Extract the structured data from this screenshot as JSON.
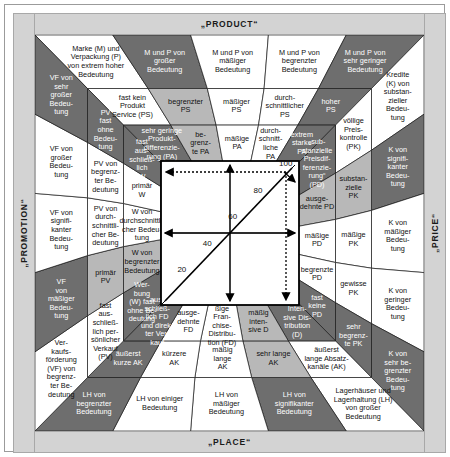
{
  "figure": {
    "title_top": "„PRODUCT“",
    "title_bottom": "„PLACE“",
    "title_left": "„PROMOTION“",
    "title_right": "„PRICE“",
    "type": "marketing-mix-matrix",
    "language": "de"
  },
  "colors": {
    "band": "#d3d3d3",
    "dark_gray": "#6e6e6e",
    "light_gray": "#b8b8b8",
    "white": "#ffffff",
    "line": "#1a1a1a"
  },
  "scale": {
    "axis_label": "Diagonalskala",
    "ticks": [
      "0",
      "20",
      "40",
      "60",
      "80",
      "100"
    ],
    "min": 0,
    "max": 100
  },
  "product": {
    "ring1": [
      "Marke (M) und\nVerpackung (P)\nvon extrem hoher\nBedeutung",
      "M und P von\ngroßer\nBedeutung",
      "M und P von\nmäßiger\nBedeutung",
      "M und P von\nbegrenzter\nBedeutung",
      "M und P von\nsehr geringer\nBedeutung"
    ],
    "ring2": [
      "fast kein\nProdukt\nService (PS)",
      "begrenzter\nPS",
      "mäßiger\nPS",
      "durch-\nschnittlicher\nPS",
      "hoher\nPS"
    ],
    "ring3": [
      "sehr geringe\nProdukt-\ndifferenzie-\nrung (PA)",
      "be-\ngrenz-\nte PA",
      "mäßige\nPA",
      "durch-\nschnitt-\nliche\nPA",
      "extrem\nstarke\nPA"
    ]
  },
  "promotion": {
    "ring1": [
      "Ver-\nkaufs-\nförderung\n(VF) von\nbegrenz-\nter Be-\ndeutung",
      "VF\nvon\nmäßiger\nBedeu-\ntung",
      "VF von\nsignifi-\nkanter\nBedeu-\ntung",
      "VF von\ngroßer\nBedeu-\ntung",
      "VF von\nsehr\ngroßer\nBedeu-\ntung"
    ],
    "ring2": [
      "fast\naus-\nschließ-\nlich per-\nsönlicher\nVerkauf\n(PV)",
      "primär\nPV",
      "PV von\ndurch-\nschnittli-\ncher Be-\ndeutung",
      "PV von\nbegrenz-\nter Be-\ndeutung",
      "PV\nfast\nohne\nBedeu-\ntung"
    ],
    "ring3": [
      "Wer-\nbung\n(W) fast\nohne Be-\ndeutung",
      "W von\nbegrenzter\nBedeutung",
      "W von\ndurchschnittli-\ncher Bedeu-\ntung",
      "primär\nW",
      "fast\naus-\nschließ-\nlich\nW"
    ]
  },
  "price": {
    "ring1": [
      "Kredite\n(K) von\nsubstan-\nzieller\nBedeu-\ntung",
      "K von\nsignifi-\nkanter\nBedeu-\ntung",
      "K von\nmäßiger\nBedeu-\ntung",
      "K von\ngeringer\nBedeu-\ntung",
      "K von\nsehr be-\ngrenzter\nBedeu-\ntung"
    ],
    "ring2": [
      "völlige\nPreis-\nkontrolle\n(PK)",
      "substan-\nzielle\nPK",
      "mäßige\nPK",
      "gewisse\nPK",
      "sehr\nbegrenz-\nte PK"
    ],
    "ring3": [
      "„sub-\nstanzielle\nPreisdif-\nferenzie-\nrung“\n(PD)",
      "ausge-\ndehnte PD",
      "mäßige\nPD",
      "begrenzte\nPD",
      "fast\nkeine\nPD"
    ]
  },
  "place": {
    "ring1": [
      "Lagerhäuser und\nLagerhaltung (LH)\nvon großer Bedeutung",
      "LH von\nsignifikanter\nBedeutung",
      "LH von\nmäßiger\nBedeutung",
      "LH von einiger\nBedeutung",
      "LH von\nbegrenzter\nBedeutung"
    ],
    "ring2": [
      "äußerst\nlange Absatz-\nkanäle (AK)",
      "sehr lange\nAK",
      "mäßig\nlange\nAK",
      "kürzere\nAK",
      "äußerst\nkurze AK"
    ],
    "ring3": [
      "Inten-\nsive Dis-\ntribution\n(D)",
      "mäßig\ninten-\nsive D",
      "mä-\nßige\nFran-\nchise-\nDistribu-\ntion (FD)",
      "ausge-\ndehnte\nFD",
      "aus-\nschließ-\nlich FD\nund direk-\nter Ver-\nkauf"
    ]
  }
}
